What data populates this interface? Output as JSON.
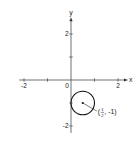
{
  "chart_data": {
    "type": "scatter",
    "title": "",
    "xlabel": "x",
    "ylabel": "y",
    "xlim": [
      -2.2,
      2.3
    ],
    "ylim": [
      -2.3,
      2.6
    ],
    "grid": false,
    "x_ticks": [
      -2,
      -1,
      1,
      2
    ],
    "y_ticks": [
      2,
      1,
      -1,
      -2
    ],
    "x_tick_labels": [
      {
        "value": -2,
        "label": "-2"
      },
      {
        "value": 0,
        "label": "0"
      },
      {
        "value": 2,
        "label": "2"
      }
    ],
    "y_tick_labels": [
      {
        "value": 2,
        "label": "2"
      },
      {
        "value": -2,
        "label": "-2"
      }
    ],
    "shapes": [
      {
        "type": "circle",
        "center": [
          0.5,
          -1
        ],
        "radius": 0.5
      }
    ],
    "points": [
      {
        "x": 0.5,
        "y": -1,
        "label": "(1/2, -1)"
      }
    ],
    "annotation": {
      "text_open": "(",
      "frac_num": "1",
      "frac_den": "2",
      "text_close": ", -1)",
      "points_to": [
        0.5,
        -1
      ]
    }
  }
}
